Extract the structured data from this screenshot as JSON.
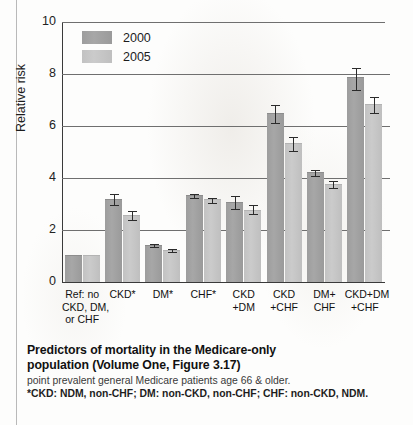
{
  "chart_data": {
    "type": "bar",
    "xlabel": "",
    "ylabel": "Relative risk",
    "ylim": [
      0,
      10
    ],
    "yticks": [
      0,
      2,
      4,
      6,
      8,
      10
    ],
    "ytick_labels": [
      "0",
      "2",
      "4",
      "6",
      "8",
      "10"
    ],
    "grid": true,
    "legend_position": "top-left",
    "categories": [
      "Ref: no CKD, DM, or CHF",
      "CKD*",
      "DM*",
      "CHF*",
      "CKD +DM",
      "CKD +CHF",
      "DM+ CHF",
      "CKD+DM +CHF"
    ],
    "category_lines": [
      [
        "Ref: no",
        "CKD, DM,",
        "or CHF"
      ],
      [
        "CKD*"
      ],
      [
        "DM*"
      ],
      [
        "CHF*"
      ],
      [
        "CKD",
        "+DM"
      ],
      [
        "CKD",
        "+CHF"
      ],
      [
        "DM+",
        "CHF"
      ],
      [
        "CKD+DM",
        "+CHF"
      ]
    ],
    "series": [
      {
        "name": "2000",
        "color": "#9f9f9f",
        "values": [
          1.0,
          3.15,
          1.4,
          3.3,
          3.05,
          6.45,
          4.2,
          7.85
        ],
        "err_low": [
          0,
          2.95,
          1.33,
          3.22,
          2.82,
          6.1,
          4.08,
          7.4
        ],
        "err_high": [
          0,
          3.38,
          1.48,
          3.38,
          3.3,
          6.82,
          4.32,
          8.22
        ]
      },
      {
        "name": "2005",
        "color": "#c6c6c6",
        "values": [
          1.0,
          2.55,
          1.2,
          3.15,
          2.75,
          5.3,
          3.75,
          6.8
        ],
        "err_low": [
          0,
          2.38,
          1.15,
          3.05,
          2.6,
          5.02,
          3.62,
          6.5
        ],
        "err_high": [
          0,
          2.72,
          1.28,
          3.25,
          2.95,
          5.58,
          3.88,
          7.12
        ]
      }
    ]
  },
  "legend": {
    "items": [
      {
        "label": "2000"
      },
      {
        "label": "2005"
      }
    ]
  },
  "caption": {
    "title_lines": [
      "Predictors of mortality in the Medicare-only",
      "population (Volume One, Figure 3.17)"
    ],
    "subtitle": "point prevalent general Medicare patients age 66 & older.",
    "note": "*CKD: NDM, non-CHF; DM: non-CKD, non-CHF; CHF: non-CKD, NDM."
  }
}
